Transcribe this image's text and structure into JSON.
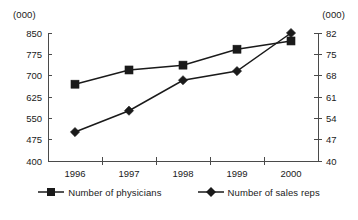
{
  "chart_data": {
    "type": "line",
    "title": "",
    "subtitle": "",
    "xlabel": "",
    "ylabel": "(000)",
    "y2label": "(000)",
    "categories": [
      "1996",
      "1997",
      "1998",
      "1999",
      "2000"
    ],
    "x": [
      1996,
      1997,
      1998,
      1999,
      2000
    ],
    "grid": false,
    "legend_position": "bottom",
    "axes": {
      "left": {
        "label": "(000)",
        "ylim": [
          400,
          850
        ],
        "ticks": [
          400,
          475,
          550,
          625,
          700,
          775,
          850
        ],
        "tick_labels": [
          "400",
          "475",
          "550",
          "625",
          "700",
          "775",
          "850"
        ]
      },
      "right": {
        "label": "(000)",
        "ylim": [
          40,
          82
        ],
        "ticks": [
          40,
          47,
          54,
          61,
          68,
          75,
          82
        ],
        "tick_labels": [
          "40",
          "47",
          "54",
          "61",
          "68",
          "75",
          "82"
        ]
      },
      "x": {
        "tick_labels": [
          "1996",
          "1997",
          "1998",
          "1999",
          "2000"
        ]
      }
    },
    "series": [
      {
        "name": "Number of physicians",
        "axis": "left",
        "marker": "square",
        "color": "#1a1a1a",
        "values": [
          670,
          720,
          737,
          793,
          822
        ]
      },
      {
        "name": "Number of sales reps",
        "axis": "right",
        "marker": "diamond",
        "color": "#1a1a1a",
        "values": [
          49.5,
          56.5,
          66.5,
          69.5,
          82
        ]
      }
    ]
  },
  "legend": {
    "items": [
      {
        "label": "Number of physicians",
        "marker": "square-marker-icon"
      },
      {
        "label": "Number of sales reps",
        "marker": "diamond-marker-icon"
      }
    ]
  },
  "colors": {
    "ink": "#1a1a1a",
    "axis": "#4a4a4a",
    "background": "#ffffff"
  }
}
